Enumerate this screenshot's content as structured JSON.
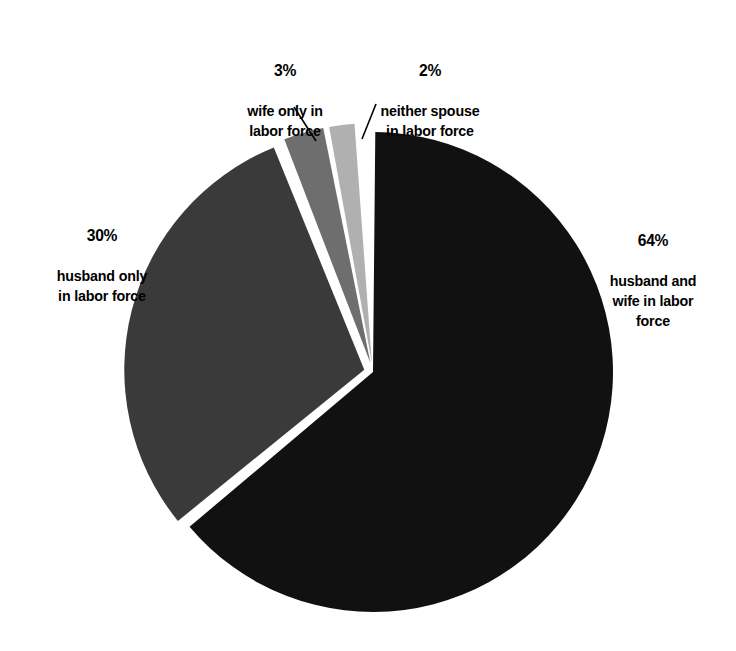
{
  "chart_data": {
    "type": "pie",
    "title": "",
    "subtitle": "",
    "xlabel": "",
    "ylabel": "",
    "units": "percent",
    "legend_position": "none",
    "grid": false,
    "labels_outside": true,
    "total_percent": 99,
    "categories": [
      "husband and wife in labor force",
      "husband only in labor force",
      "wife only in labor force",
      "neither spouse in labor force"
    ],
    "values": [
      64,
      30,
      3,
      2
    ],
    "value_labels": [
      "64%",
      "30%",
      "3%",
      "2%"
    ],
    "colors": [
      "#111111",
      "#3a3a3a",
      "#6e6e6e",
      "#b0b0b0"
    ],
    "slices": [
      {
        "percent_text": "64%",
        "value": 64,
        "description": "husband and\nwife in labor\nforce",
        "color": "#111111",
        "exploded": false,
        "leader_line": false
      },
      {
        "percent_text": "30%",
        "value": 30,
        "description": "husband only\nin labor force",
        "color": "#3a3a3a",
        "exploded": true,
        "leader_line": false
      },
      {
        "percent_text": "3%",
        "value": 3,
        "description": "wife only in\nlabor force",
        "color": "#6e6e6e",
        "exploded": true,
        "leader_line": true
      },
      {
        "percent_text": "2%",
        "value": 2,
        "description": "neither spouse\nin labor force",
        "color": "#b0b0b0",
        "exploded": true,
        "leader_line": true
      }
    ],
    "background_color": "#ffffff",
    "separator_color": "#ffffff",
    "start_angle_deg": 0,
    "direction": "clockwise"
  },
  "labels": {
    "wife_only": {
      "percent": "3%",
      "description": "wife only in\nlabor force"
    },
    "neither_spouse": {
      "percent": "2%",
      "description": "neither spouse\nin labor force"
    },
    "husband_only": {
      "percent": "30%",
      "description": "husband only\nin labor force"
    },
    "both_spouses": {
      "percent": "64%",
      "description": "husband and\nwife in labor\nforce"
    }
  }
}
